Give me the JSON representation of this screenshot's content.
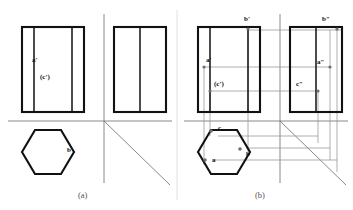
{
  "figure": {
    "panels": [
      {
        "id": "a",
        "caption": "(a)",
        "description": "Front view, side view and top view without projection lines",
        "labels": [
          {
            "key": "a_front",
            "text": "a'",
            "x": 32,
            "y": 62
          },
          {
            "key": "c_front",
            "text": "(c')",
            "x": 40,
            "y": 79
          },
          {
            "key": "b_top",
            "text": "b",
            "x": 67,
            "y": 152
          }
        ]
      },
      {
        "id": "b",
        "caption": "(b)",
        "description": "Same three views with construction and projection lines locating points a, b and c",
        "labels": [
          {
            "key": "b_front",
            "text": "b'",
            "x": 244,
            "y": 21
          },
          {
            "key": "b_side",
            "text": "b″",
            "x": 322,
            "y": 21
          },
          {
            "key": "a_front",
            "text": "a'",
            "x": 206,
            "y": 62
          },
          {
            "key": "a_side",
            "text": "a″",
            "x": 317,
            "y": 64
          },
          {
            "key": "c_front",
            "text": "(c')",
            "x": 214,
            "y": 86
          },
          {
            "key": "c_side",
            "text": "c″",
            "x": 296,
            "y": 86
          },
          {
            "key": "c_top",
            "text": "c",
            "x": 218,
            "y": 130
          },
          {
            "key": "a_top",
            "text": "a",
            "x": 212,
            "y": 162
          },
          {
            "key": "b_top",
            "text": "b",
            "x": 246,
            "y": 156
          }
        ]
      }
    ],
    "colors": {
      "outline": "#111111",
      "projection_line": "#9a9a9a",
      "axis_line": "#7a7a7a",
      "point_marker": "#6f6f6f",
      "background": "#ffffff",
      "caption_text": "#555555"
    },
    "geometry": {
      "panel_a": {
        "front_view_rect": {
          "x": 22,
          "y": 27,
          "w": 62,
          "h": 85
        },
        "front_inner_lines_x": [
          34,
          72
        ],
        "side_view_rect": {
          "x": 114,
          "y": 27,
          "w": 52,
          "h": 85
        },
        "side_inner_lines_x": [
          140
        ],
        "ground_line_y": 121,
        "vertical_axis_x": 104,
        "miter_line": {
          "x1": 104,
          "y1": 121,
          "x2": 168,
          "y2": 183
        },
        "hexagon_center": {
          "cx": 48,
          "cy": 152
        },
        "hexagon_rx": 26,
        "hexagon_ry": 23
      },
      "panel_b": {
        "front_view_rect": {
          "x": 198,
          "y": 27,
          "w": 62,
          "h": 85
        },
        "front_inner_lines_x": [
          210,
          248
        ],
        "side_view_rect": {
          "x": 290,
          "y": 27,
          "w": 52,
          "h": 85
        },
        "side_inner_lines_x": [
          316
        ],
        "ground_line_y": 121,
        "vertical_axis_x": 280,
        "miter_line": {
          "x1": 280,
          "y1": 121,
          "x2": 344,
          "y2": 183
        },
        "hexagon_center": {
          "cx": 224,
          "cy": 152
        },
        "hexagon_rx": 26,
        "hexagon_ry": 23
      }
    }
  }
}
